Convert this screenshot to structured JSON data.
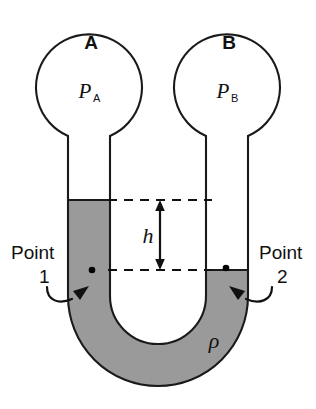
{
  "figure": {
    "kind": "u-tube-manometer-diagram",
    "background_color": "#ffffff",
    "outline_color": "#1a1a1a",
    "fluid_color": "#9a9a9a"
  },
  "bulbs": {
    "left": {
      "label": "A",
      "pressure_symbol": "P",
      "pressure_subscript": "A"
    },
    "right": {
      "label": "B",
      "pressure_symbol": "P",
      "pressure_subscript": "B"
    }
  },
  "dimension": {
    "height_symbol": "h"
  },
  "fluid": {
    "density_symbol": "ρ"
  },
  "annotations": {
    "point_one": {
      "word": "Point",
      "number": "1"
    },
    "point_two": {
      "word": "Point",
      "number": "2"
    }
  }
}
